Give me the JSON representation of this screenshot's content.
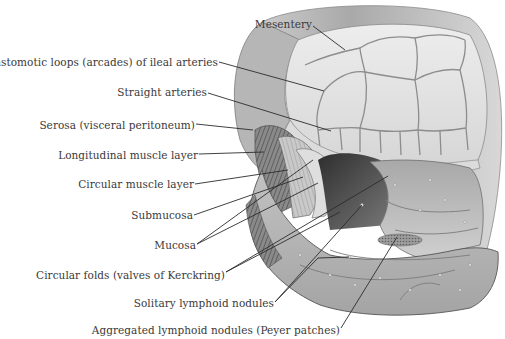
{
  "figure": {
    "labels": [
      {
        "id": "mesentery",
        "text": "Mesentery",
        "right": 312,
        "top": 18,
        "x1": 313,
        "y1": 26,
        "x2": 345,
        "y2": 50
      },
      {
        "id": "anastomotic-loops",
        "text": "Anastomotic loops (arcades) of ileal arteries",
        "right": 218,
        "top": 56,
        "x1": 219,
        "y1": 62,
        "x2": 324,
        "y2": 91
      },
      {
        "id": "straight-arteries",
        "text": "Straight arteries",
        "right": 207,
        "top": 86,
        "x1": 208,
        "y1": 93,
        "x2": 331,
        "y2": 131
      },
      {
        "id": "serosa",
        "text": "Serosa (visceral peritoneum)",
        "right": 195,
        "top": 119,
        "x1": 196,
        "y1": 124,
        "x2": 253,
        "y2": 130
      },
      {
        "id": "longitudinal-muscle",
        "text": "Longitudinal muscle layer",
        "right": 198,
        "top": 149,
        "x1": 199,
        "y1": 154,
        "x2": 264,
        "y2": 152
      },
      {
        "id": "circular-muscle",
        "text": "Circular muscle layer",
        "right": 194,
        "top": 178,
        "x1": 195,
        "y1": 184,
        "x2": 288,
        "y2": 170
      },
      {
        "id": "submucosa",
        "text": "Submucosa",
        "right": 193,
        "top": 209,
        "x1": 194,
        "y1": 215,
        "x2": 303,
        "y2": 177
      },
      {
        "id": "mucosa",
        "text": "Mucosa",
        "right": 196,
        "top": 239,
        "x1": 197,
        "y1": 244,
        "x2": 318,
        "y2": 183
      },
      {
        "id": "circular-folds",
        "text": "Circular folds (valves of Kerckring)",
        "right": 225,
        "top": 269,
        "x1": 226,
        "y1": 272,
        "x2": 388,
        "y2": 176
      },
      {
        "id": "solitary-nodules",
        "text": "Solitary lymphoid nodules",
        "right": 274,
        "top": 297,
        "x1": 275,
        "y1": 302,
        "x2": 362,
        "y2": 205
      },
      {
        "id": "peyer-patches",
        "text": "Aggregated lymphoid nodules (Peyer patches)",
        "right": 340,
        "top": 324,
        "x1": 341,
        "y1": 328,
        "x2": 397,
        "y2": 237
      }
    ],
    "extra_leaders": [
      {
        "x1": 226,
        "y1": 272,
        "x2": 340,
        "y2": 212
      },
      {
        "x1": 197,
        "y1": 244,
        "x2": 313,
        "y2": 160
      },
      {
        "x1": 275,
        "y1": 302,
        "x2": 318,
        "y2": 258
      },
      {
        "x1": 318,
        "y1": 258,
        "x2": 349,
        "y2": 257
      }
    ],
    "colors": {
      "ink": "#2b2b2b",
      "label": "#3a3a3a",
      "tissue_light": "#e6e6e6",
      "tissue_mid": "#b9b9b9",
      "tissue_dark": "#6e6e6e",
      "lumen": "#3f3f3f"
    }
  }
}
